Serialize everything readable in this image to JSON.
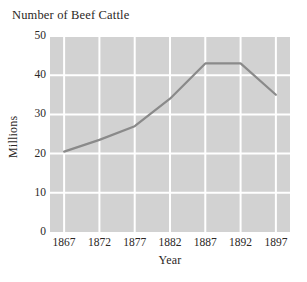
{
  "chart_data": {
    "type": "line",
    "title": "Number of Beef Cattle",
    "xlabel": "Year",
    "ylabel": "Millions",
    "x": [
      1867,
      1872,
      1877,
      1882,
      1887,
      1892,
      1897
    ],
    "categories": [
      "1867",
      "1872",
      "1877",
      "1882",
      "1887",
      "1892",
      "1897"
    ],
    "values": [
      20.5,
      23.5,
      27,
      34,
      43,
      43,
      35
    ],
    "series": [
      {
        "name": "Beef cattle",
        "values": [
          20.5,
          23.5,
          27,
          34,
          43,
          43,
          35
        ]
      }
    ],
    "xlim": [
      1865,
      1899
    ],
    "ylim": [
      0,
      50
    ],
    "ytick_labels": [
      "0",
      "10",
      "20",
      "30",
      "40",
      "50"
    ],
    "ytick_values": [
      0,
      10,
      20,
      30,
      40,
      50
    ],
    "grid": true,
    "legend": "none",
    "colors": {
      "plot_background": "#d2d2d2",
      "gridline": "#ffffff",
      "line": "#8a8a8a",
      "text": "#2b2725",
      "page_background": "#ffffff"
    }
  }
}
